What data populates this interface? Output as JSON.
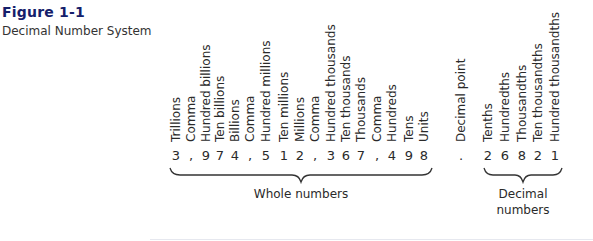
{
  "figure": {
    "title": "Figure 1-1",
    "caption": "Decimal Number System",
    "title_color": "#15206b"
  },
  "columns": [
    {
      "label": "Trillions",
      "symbol": "3",
      "x": 176
    },
    {
      "label": "Comma",
      "symbol": ",",
      "x": 191
    },
    {
      "label": "Hundred billions",
      "symbol": "9",
      "x": 206
    },
    {
      "label": "Ten billions",
      "symbol": "7",
      "x": 220
    },
    {
      "label": "Billions",
      "symbol": "4",
      "x": 235
    },
    {
      "label": "Comma",
      "symbol": ",",
      "x": 250
    },
    {
      "label": "Hundred millions",
      "symbol": "5",
      "x": 266
    },
    {
      "label": "Ten millions",
      "symbol": "1",
      "x": 284
    },
    {
      "label": "Millions",
      "symbol": "2",
      "x": 300
    },
    {
      "label": "Comma",
      "symbol": ",",
      "x": 315
    },
    {
      "label": "Hundred thousands",
      "symbol": "3",
      "x": 331
    },
    {
      "label": "Ten thousands",
      "symbol": "6",
      "x": 346
    },
    {
      "label": "Thousands",
      "symbol": "7",
      "x": 361
    },
    {
      "label": "Comma",
      "symbol": ",",
      "x": 377
    },
    {
      "label": "Hundreds",
      "symbol": "4",
      "x": 392
    },
    {
      "label": "Tens",
      "symbol": "9",
      "x": 409
    },
    {
      "label": "Units",
      "symbol": "8",
      "x": 424
    },
    {
      "label": "Decimal point",
      "symbol": ".",
      "x": 461
    },
    {
      "label": "Tenths",
      "symbol": "2",
      "x": 488
    },
    {
      "label": "Hundredths",
      "symbol": "6",
      "x": 505
    },
    {
      "label": "Thousandths",
      "symbol": "8",
      "x": 522
    },
    {
      "label": "Ten thousandths",
      "symbol": "2",
      "x": 538
    },
    {
      "label": "Hundred thousandths",
      "symbol": "1",
      "x": 555
    }
  ],
  "groups": {
    "whole": {
      "label": "Whole numbers",
      "x1": 170,
      "x2": 432
    },
    "decimal": {
      "label_line1": "Decimal",
      "label_line2": "numbers",
      "x1": 484,
      "x2": 562
    }
  }
}
